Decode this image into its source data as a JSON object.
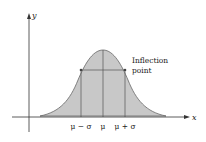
{
  "diagram": {
    "axes": {
      "x_label": "x",
      "y_label": "y"
    },
    "tick_labels": [
      "μ − σ",
      "μ",
      "μ + σ"
    ],
    "annotation": {
      "line1": "Inflection",
      "line2": "point"
    },
    "colors": {
      "fill": "#c8c8c8",
      "stroke": "#555555",
      "axis": "#333333"
    }
  }
}
